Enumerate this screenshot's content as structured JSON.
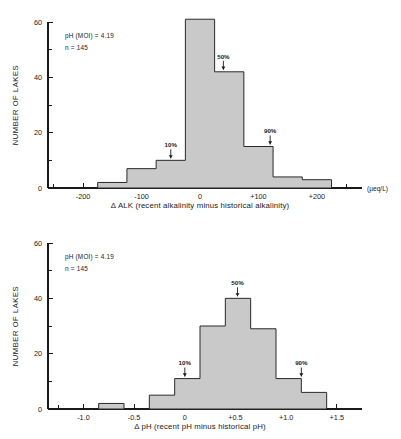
{
  "figure": {
    "background": "#ffffff",
    "bar_fill": "#c9c9c9",
    "bar_stroke": "#2a2a2a",
    "ink": "#1a1a1a"
  },
  "chart_data": [
    {
      "id": "delta-alk",
      "type": "bar",
      "title": "",
      "xlabel": "Δ ALK (recent alkalinity minus historical alkalinity)",
      "ylabel": "NUMBER OF LAKES",
      "units": "(µeq/L)",
      "xlim": [
        -260,
        260
      ],
      "ylim": [
        0,
        60
      ],
      "yticks": [
        0,
        20,
        40,
        60
      ],
      "yticklabels": [
        "0",
        "20",
        "40",
        "60"
      ],
      "yminorticks": [
        10,
        30,
        50
      ],
      "xticks": [
        -200,
        -100,
        0,
        100,
        200
      ],
      "xticklabels": [
        "-200",
        "-100",
        "0",
        "+100",
        "+200"
      ],
      "xminorticks": [
        -250,
        -150,
        -50,
        50,
        150,
        250
      ],
      "grid": false,
      "legend": "none",
      "bin_width": 25,
      "bin_edges": [
        -175,
        -150,
        -125,
        -100,
        -75,
        -50,
        -25,
        0,
        25,
        50,
        75,
        100,
        125,
        150,
        175,
        200,
        225
      ],
      "values": [
        2,
        2,
        2,
        7,
        7,
        10,
        10,
        61,
        61,
        42,
        42,
        15,
        4,
        4,
        3,
        3
      ],
      "bars": [
        {
          "x0": -175,
          "x1": -125,
          "height": 2
        },
        {
          "x0": -125,
          "x1": -75,
          "height": 7
        },
        {
          "x0": -75,
          "x1": -25,
          "height": 10
        },
        {
          "x0": -25,
          "x1": 25,
          "height": 61
        },
        {
          "x0": 25,
          "x1": 75,
          "height": 42
        },
        {
          "x0": 75,
          "x1": 125,
          "height": 15
        },
        {
          "x0": 125,
          "x1": 175,
          "height": 4
        },
        {
          "x0": 175,
          "x1": 225,
          "height": 3
        }
      ],
      "annotations": [
        {
          "label": "pH (MOI) = 4.19"
        },
        {
          "label": "n = 145"
        }
      ],
      "percentiles": [
        {
          "label": "10%",
          "x": -50,
          "y": 10
        },
        {
          "label": "50%",
          "x": 40,
          "y": 42
        },
        {
          "label": "90%",
          "x": 120,
          "y": 15
        }
      ]
    },
    {
      "id": "delta-ph",
      "type": "bar",
      "title": "",
      "xlabel": "Δ pH (recent pH minus historical pH)",
      "ylabel": "NUMBER OF LAKES",
      "units": "",
      "xlim": [
        -1.35,
        1.65
      ],
      "ylim": [
        0,
        60
      ],
      "yticks": [
        0,
        20,
        40,
        60
      ],
      "yticklabels": [
        "0",
        "20",
        "40",
        "60"
      ],
      "yminorticks": [
        10,
        30,
        50
      ],
      "xticks": [
        -1.0,
        -0.5,
        0,
        0.5,
        1.0,
        1.5
      ],
      "xticklabels": [
        "-1.0",
        "-0.5",
        "0",
        "+0.5",
        "+1.0",
        "+1.5"
      ],
      "xminorticks": [
        -1.25,
        -0.75,
        -0.25,
        0.25,
        0.75,
        1.25
      ],
      "grid": false,
      "legend": "none",
      "bin_width": 0.25,
      "bars": [
        {
          "x0": -0.85,
          "x1": -0.6,
          "height": 2
        },
        {
          "x0": -0.35,
          "x1": -0.1,
          "height": 5
        },
        {
          "x0": -0.1,
          "x1": 0.15,
          "height": 11
        },
        {
          "x0": 0.15,
          "x1": 0.4,
          "height": 30
        },
        {
          "x0": 0.4,
          "x1": 0.65,
          "height": 40
        },
        {
          "x0": 0.65,
          "x1": 0.9,
          "height": 29
        },
        {
          "x0": 0.9,
          "x1": 1.15,
          "height": 11
        },
        {
          "x0": 1.15,
          "x1": 1.4,
          "height": 6
        }
      ],
      "annotations": [
        {
          "label": "pH (MOI) = 4.19"
        },
        {
          "label": "n = 145"
        }
      ],
      "percentiles": [
        {
          "label": "10%",
          "x": 0.0,
          "y": 11
        },
        {
          "label": "50%",
          "x": 0.52,
          "y": 40
        },
        {
          "label": "90%",
          "x": 1.15,
          "y": 11
        }
      ]
    }
  ]
}
